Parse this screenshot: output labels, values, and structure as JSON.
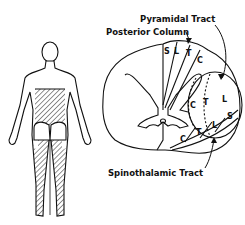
{
  "diagram": {
    "labels": {
      "pyramidal_tract": "Pyramidal Tract",
      "posterior_column": "Posterior Column",
      "spinothalamic_tract": "Spinothalamic Tract"
    },
    "posterior_column_segments": [
      "S",
      "L",
      "T",
      "C"
    ],
    "pyramidal_tract_segments": [
      "C",
      "T",
      "L",
      "S"
    ],
    "spinothalamic_tract_segments": [
      "C",
      "T",
      "L",
      "S"
    ],
    "colors": {
      "ink": "#111111",
      "background": "#ffffff"
    }
  }
}
